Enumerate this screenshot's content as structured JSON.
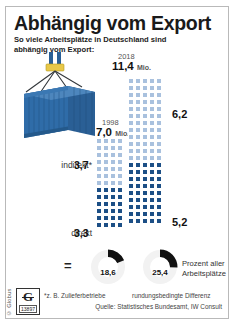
{
  "header": {
    "title": "Abhängig vom Export",
    "subtitle": "So viele Arbeitsplätze in Deutschland sind abhängig vom Export:"
  },
  "columns": {
    "y1998": {
      "year": "1998",
      "value": "7,0",
      "unit": "Mio."
    },
    "y2018": {
      "year": "2018",
      "value": "11,4",
      "unit": "Mio."
    }
  },
  "labels": {
    "indirekt": "indirekt*",
    "indirekt_1998": "3,7",
    "indirekt_2018": "6,2",
    "direkt": "direkt",
    "direkt_1998": "3,3",
    "direkt_2018": "5,2",
    "equals": "="
  },
  "donuts": [
    {
      "name": "share-1998",
      "value": "18,6",
      "percent": 18.6
    },
    {
      "name": "share-2018",
      "value": "25,4",
      "percent": 25.4
    }
  ],
  "percent_caption": "Prozent aller Arbeitsplätze",
  "footer": {
    "note_left": "*z. B. Zulieferbetriebe",
    "note_right": "rundungsbedingte Differenz",
    "source": "Quelle: Statistisches Bundesamt, IW Consult"
  },
  "logo": {
    "mark": "G",
    "number": "13897",
    "brand": "© Globus"
  },
  "colors": {
    "light_blue": "#a9c1de",
    "dark_blue": "#1c4f86",
    "container_blue": "#2f6ca8",
    "donut_dark": "#111111",
    "frame": "#b9b9b9"
  },
  "chart_data": {
    "type": "bar",
    "title": "Abhängig vom Export",
    "subtitle": "So viele Arbeitsplätze in Deutschland sind abhängig vom Export:",
    "unit": "Millionen Arbeitsplätze",
    "categories": [
      "1998",
      "2018"
    ],
    "series": [
      {
        "name": "direkt",
        "values": [
          3.3,
          5.2
        ],
        "color": "#1c4f86"
      },
      {
        "name": "indirekt*",
        "values": [
          3.7,
          6.2
        ],
        "color": "#a9c1de"
      }
    ],
    "totals": [
      7.0,
      11.4
    ],
    "share_of_all_jobs_percent": [
      18.6,
      25.4
    ],
    "share_label": "Prozent aller Arbeitsplätze",
    "notes": [
      "*z. B. Zulieferbetriebe",
      "rundungsbedingte Differenz"
    ],
    "source": "Quelle: Statistisches Bundesamt, IW Consult",
    "legend_position": "inline-left",
    "grid": false,
    "pictogram": {
      "columns": [
        {
          "year": "1998",
          "cols": 4,
          "dark_rows": 6,
          "light_rows": 7
        },
        {
          "year": "2018",
          "cols": 5,
          "dark_rows": 9,
          "light_rows": 12
        }
      ]
    }
  }
}
